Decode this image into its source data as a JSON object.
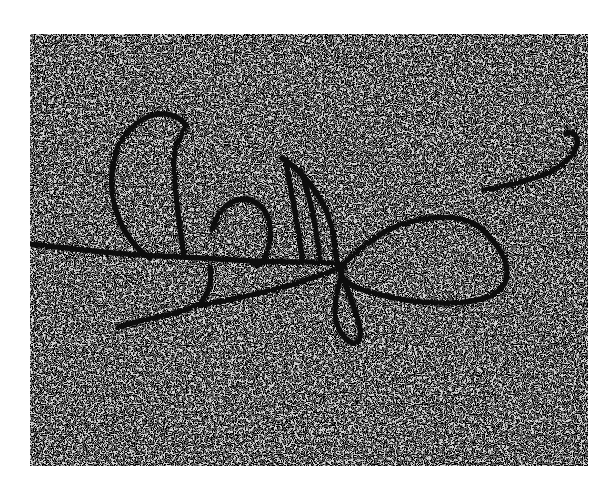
{
  "image": {
    "kind": "electron-micrograph",
    "description": "Grainy black-and-white electron micrograph of a tangled DNA strand with loops on a speckled background",
    "frame": {
      "x": 30,
      "y": 34,
      "width": 558,
      "height": 432
    },
    "colors": {
      "page_background": "#ffffff",
      "field_light": "#d8d8d8",
      "grain_dark": "#1a1a1a",
      "strand": "#111111"
    },
    "features": [
      {
        "name": "main-horizontal-strand",
        "label": ""
      },
      {
        "name": "left-c-loop",
        "label": ""
      },
      {
        "name": "middle-small-loop",
        "label": ""
      },
      {
        "name": "vertical-arc-loops",
        "label": ""
      },
      {
        "name": "large-right-loop",
        "label": ""
      },
      {
        "name": "lower-left-branch",
        "label": ""
      },
      {
        "name": "lower-small-loop",
        "label": ""
      },
      {
        "name": "upper-right-tail-strand",
        "label": ""
      }
    ]
  }
}
